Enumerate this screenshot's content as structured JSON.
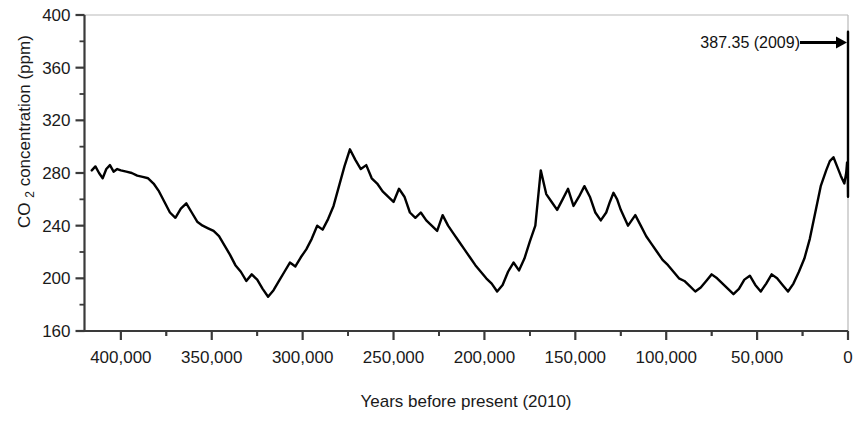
{
  "chart_data": {
    "type": "line",
    "title": "",
    "xlabel": "Years before present (2010)",
    "ylabel": "CO 2 concentration (ppm)",
    "ylabel_main": "CO",
    "ylabel_sub": "2",
    "ylabel_rest": " concentration (ppm)",
    "xlim": [
      420000,
      0
    ],
    "ylim": [
      160,
      400
    ],
    "x_axis_reversed": true,
    "grid": false,
    "legend": null,
    "y_ticks": [
      160,
      200,
      240,
      280,
      320,
      360,
      400
    ],
    "y_tick_labels": [
      "160",
      "200",
      "240",
      "280",
      "320",
      "360",
      "400"
    ],
    "y_minor_step": 20,
    "x_ticks": [
      400000,
      350000,
      300000,
      250000,
      200000,
      150000,
      100000,
      50000,
      0
    ],
    "x_tick_labels": [
      "400,000",
      "350,000",
      "300,000",
      "250,000",
      "200,000",
      "150,000",
      "100,000",
      "50,000",
      "0"
    ],
    "x_minor_step": 25000,
    "line_color": "#000000",
    "line_width": 2.4,
    "annotations": [
      {
        "name": "modern-co2-annotation",
        "text": "387.35 (2009)",
        "value": 387.35,
        "year": 2009,
        "arrow": "right-arrow",
        "points_to_x": 0,
        "points_to_y": 387.35
      }
    ],
    "series": [
      {
        "name": "Vostok / Law Dome ice-core CO2",
        "units": "ppm",
        "x": [
          416000,
          414000,
          412000,
          410000,
          408000,
          406000,
          404000,
          402000,
          400000,
          397000,
          394000,
          391000,
          388000,
          385000,
          382000,
          379000,
          376000,
          373000,
          370000,
          367000,
          364000,
          361000,
          358000,
          355000,
          352000,
          349000,
          346000,
          343000,
          340000,
          337000,
          334000,
          331000,
          328000,
          325000,
          322000,
          319000,
          316000,
          313000,
          310000,
          307000,
          304000,
          301000,
          298000,
          295000,
          292000,
          289000,
          286000,
          283000,
          280000,
          277000,
          274000,
          271000,
          268000,
          265000,
          262000,
          259000,
          256000,
          253000,
          250000,
          247000,
          244000,
          241000,
          238000,
          235000,
          232000,
          229000,
          226000,
          223000,
          220000,
          217000,
          214000,
          211000,
          208000,
          205000,
          202000,
          199000,
          196000,
          193000,
          190000,
          187000,
          184000,
          181000,
          178000,
          175000,
          172000,
          169000,
          166000,
          163000,
          160000,
          157000,
          154000,
          151000,
          148000,
          145000,
          142000,
          139000,
          136000,
          133000,
          131000,
          129000,
          127000,
          125000,
          123000,
          121000,
          119000,
          117000,
          114000,
          111000,
          108000,
          105000,
          102000,
          99000,
          96000,
          93000,
          90000,
          87000,
          84000,
          81000,
          78000,
          75000,
          72000,
          69000,
          66000,
          63000,
          60000,
          57000,
          54000,
          51000,
          48000,
          45000,
          42000,
          39000,
          36000,
          33000,
          30000,
          27000,
          24000,
          21000,
          18000,
          15000,
          12000,
          10000,
          8000,
          6000,
          4000,
          2000,
          1000,
          500,
          200,
          100,
          50,
          0
        ],
        "y": [
          282,
          285,
          280,
          276,
          283,
          286,
          281,
          283,
          282,
          281,
          280,
          278,
          277,
          276,
          272,
          266,
          258,
          250,
          246,
          253,
          257,
          250,
          243,
          240,
          238,
          236,
          232,
          225,
          218,
          210,
          205,
          198,
          203,
          199,
          192,
          186,
          191,
          198,
          205,
          212,
          209,
          216,
          222,
          230,
          240,
          237,
          245,
          255,
          270,
          285,
          298,
          290,
          283,
          286,
          276,
          272,
          266,
          262,
          258,
          268,
          262,
          250,
          246,
          250,
          244,
          240,
          236,
          248,
          240,
          234,
          228,
          222,
          216,
          210,
          205,
          200,
          196,
          190,
          195,
          205,
          212,
          206,
          215,
          228,
          240,
          282,
          264,
          258,
          252,
          260,
          268,
          255,
          262,
          270,
          262,
          250,
          244,
          250,
          258,
          265,
          260,
          252,
          246,
          240,
          244,
          248,
          240,
          232,
          226,
          220,
          214,
          210,
          205,
          200,
          198,
          194,
          190,
          193,
          198,
          203,
          200,
          196,
          192,
          188,
          192,
          199,
          202,
          195,
          190,
          196,
          203,
          200,
          195,
          190,
          196,
          205,
          215,
          230,
          250,
          270,
          282,
          289,
          292,
          285,
          278,
          272,
          280,
          288,
          282,
          275,
          268,
          262
        ]
      }
    ]
  },
  "axes": {
    "x_axis_title": "Years before present (2010)",
    "y_axis_title_parts": [
      "CO",
      "2",
      " concentration (ppm)"
    ]
  }
}
